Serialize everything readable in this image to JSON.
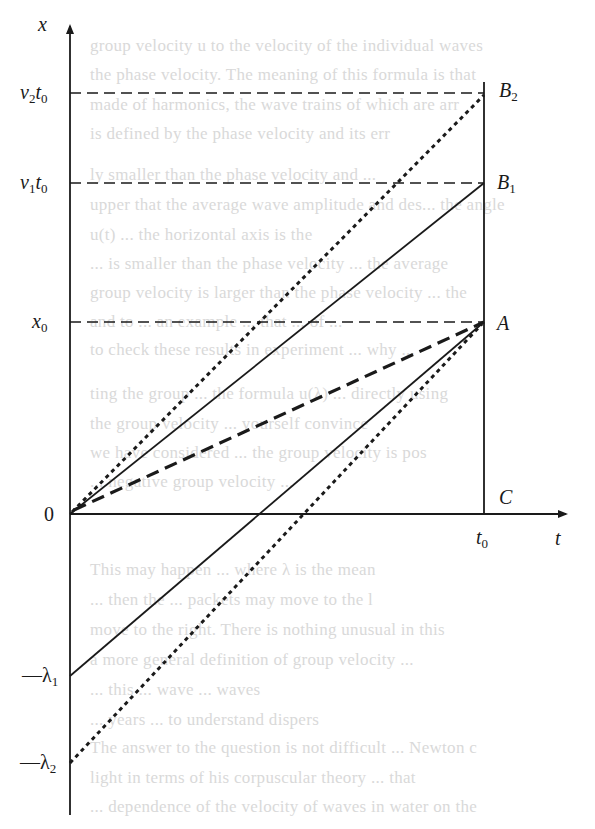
{
  "figure": {
    "kind": "space-time diagram of wave packet propagation (group vs phase velocity)",
    "axes": {
      "vertical_label": "x",
      "horizontal_label": "t",
      "origin_label": "0"
    },
    "left_labels": {
      "v2t0": {
        "main": "v",
        "sub": "2",
        "tail": "t",
        "tail_sub": "0"
      },
      "v1t0": {
        "main": "v",
        "sub": "1",
        "tail": "t",
        "tail_sub": "0"
      },
      "x0": {
        "main": "x",
        "sub": "0"
      },
      "lambda1": {
        "main": "—λ",
        "sub": "1"
      },
      "lambda2": {
        "main": "—λ",
        "sub": "2"
      }
    },
    "point_labels": {
      "B2": {
        "main": "B",
        "sub": "2"
      },
      "B1": {
        "main": "B",
        "sub": "1"
      },
      "A": {
        "main": "A"
      },
      "C": {
        "main": "C"
      }
    },
    "time_label": {
      "main": "t",
      "sub": "0"
    },
    "line_color": "#1a1a1a",
    "lines": [
      {
        "id": "origin-to-B2",
        "style": "dotted",
        "from": "0",
        "to": "B2"
      },
      {
        "id": "origin-to-B1",
        "style": "solid",
        "from": "0",
        "to": "B1"
      },
      {
        "id": "origin-to-A",
        "style": "dashed-bold",
        "from": "0",
        "to": "A"
      },
      {
        "id": "lambda1-to-A",
        "style": "solid",
        "from": "-λ1",
        "to": "A"
      },
      {
        "id": "lambda2-to-A",
        "style": "dotted",
        "from": "-λ2",
        "to": "A"
      },
      {
        "id": "v2t0-guide",
        "style": "dashed",
        "from": "v2t0",
        "to": "B2"
      },
      {
        "id": "v1t0-guide",
        "style": "dashed",
        "from": "v1t0",
        "to": "B1"
      },
      {
        "id": "x0-guide",
        "style": "dashed",
        "from": "x0",
        "to": "A"
      },
      {
        "id": "t0-vertical",
        "style": "solid",
        "from": "C",
        "to": "above B2"
      }
    ]
  },
  "bleed_through_text": [
    "group velocity u to the velocity of the individual waves",
    "the phase velocity. The meaning of this formula is that",
    "made of harmonics, the wave trains of which are arr",
    "is defined by the phase velocity and its err",
    "",
    "ly smaller than the phase velocity and ...",
    "upper that the average wave amplitude and des... the angle",
    "u(t) ... the horizontal axis is the",
    "... is smaller than the phase velocity ... the average",
    "group velocity is larger than the phase velocity ... the",
    "and to ... an example ... that ... of ...",
    "to check these results in experiment ... why ...",
    "",
    "ting the group ... the formula u(λ) ... directly using",
    "the group velocity ... yourself convince",
    "we have considered ... the group velocity is pos",
    "... negative group velocity ...",
    "This may happen ... where λ is the mean",
    "... then the ... packets may move to the l",
    "move to the right. There is nothing unusual in this",
    "a more general definition of group velocity ...",
    "... this ... wave ... waves",
    "... years ... to understand dispers",
    "The answer to the question is not difficult ... Newton c",
    "light in terms of his corpuscular theory ... that",
    "... dependence of the velocity of waves in water on the",
    "... "
  ]
}
